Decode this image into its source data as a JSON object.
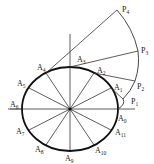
{
  "diagram": {
    "title": "",
    "center": {
      "x": 70,
      "y": 109
    },
    "ellipse": {
      "rx": 48,
      "ry": 42
    },
    "colors": {
      "stroke": "#222222",
      "thin": "#444444",
      "background": "#ffffff"
    },
    "ellipse_points": [
      {
        "name": "A0",
        "base": "A",
        "sub": "0",
        "x": 118,
        "y": 109,
        "lx": 118,
        "ly": 121
      },
      {
        "name": "A1",
        "base": "A",
        "sub": "1",
        "x": 111,
        "y": 88,
        "lx": 114,
        "ly": 90
      },
      {
        "name": "A2",
        "base": "A",
        "sub": "2",
        "x": 94,
        "y": 73,
        "lx": 97,
        "ly": 73
      },
      {
        "name": "A3",
        "base": "A",
        "sub": "3",
        "x": 70,
        "y": 67,
        "lx": 77,
        "ly": 62
      },
      {
        "name": "A4",
        "base": "A",
        "sub": "4",
        "x": 46,
        "y": 73,
        "lx": 37,
        "ly": 70
      },
      {
        "name": "A5",
        "base": "A",
        "sub": "5",
        "x": 29,
        "y": 88,
        "lx": 17,
        "ly": 86
      },
      {
        "name": "A6",
        "base": "A",
        "sub": "6",
        "x": 22,
        "y": 109,
        "lx": 10,
        "ly": 107
      },
      {
        "name": "A7",
        "base": "A",
        "sub": "7",
        "x": 29,
        "y": 130,
        "lx": 16,
        "ly": 134
      },
      {
        "name": "A8",
        "base": "A",
        "sub": "8",
        "x": 46,
        "y": 145,
        "lx": 35,
        "ly": 152
      },
      {
        "name": "A9",
        "base": "A",
        "sub": "9",
        "x": 70,
        "y": 151,
        "lx": 65,
        "ly": 161
      },
      {
        "name": "A10",
        "base": "A",
        "sub": "10",
        "x": 94,
        "y": 145,
        "lx": 95,
        "ly": 153
      },
      {
        "name": "A11",
        "base": "A",
        "sub": "11",
        "x": 111,
        "y": 130,
        "lx": 115,
        "ly": 135
      }
    ],
    "involute_points": [
      {
        "name": "P1",
        "base": "P",
        "sub": "1",
        "x": 123,
        "y": 99,
        "lx": 131,
        "ly": 104,
        "from": "A1"
      },
      {
        "name": "P2",
        "base": "P",
        "sub": "2",
        "x": 135,
        "y": 81,
        "lx": 137,
        "ly": 89,
        "from": "A2"
      },
      {
        "name": "P3",
        "base": "P",
        "sub": "3",
        "x": 138,
        "y": 51,
        "lx": 141,
        "ly": 53,
        "from": "A3"
      },
      {
        "name": "P4",
        "base": "P",
        "sub": "4",
        "x": 117,
        "y": 10,
        "lx": 122,
        "ly": 12,
        "from": "A4"
      }
    ],
    "axes": {
      "horizontal": {
        "x1": 8,
        "x2": 135,
        "y": 109
      },
      "vertical": {
        "x": 70,
        "y1": 34,
        "y2": 151
      }
    },
    "outer_curve": "M118,109 Q126,104 123,99 Q131,91 135,81 Q140,66 138,51 Q133,28 117,10"
  }
}
